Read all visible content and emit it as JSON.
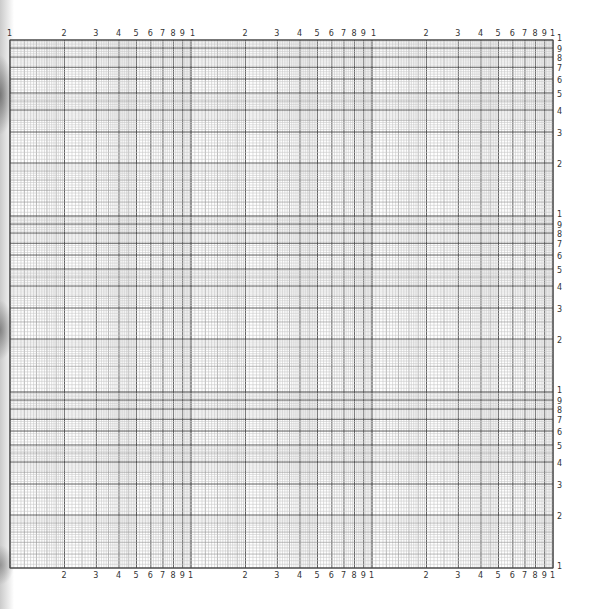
{
  "page": {
    "type": "log-log graph paper",
    "cycles_x": 3,
    "cycles_y": 3,
    "colors": {
      "background": "#ffffff",
      "major_line": "#4a4a4a",
      "minor_line": "#9a9a9a",
      "fine_line": "#c8c8c8",
      "label": "#333333"
    }
  },
  "grid": {
    "left": 10,
    "right": 553,
    "top": 40,
    "bottom": 568
  },
  "top_axis": {
    "labels": [
      "1",
      "2",
      "3",
      "4",
      "5",
      "6",
      "7",
      "8",
      "9",
      "1",
      "2",
      "3",
      "4",
      "5",
      "6",
      "7",
      "8",
      "9",
      "1",
      "2",
      "3",
      "4",
      "5",
      "6",
      "7",
      "8",
      "9",
      "1"
    ]
  },
  "bottom_axis": {
    "labels": [
      "2",
      "3",
      "4",
      "5",
      "6",
      "7",
      "8",
      "9",
      "1",
      "2",
      "3",
      "4",
      "5",
      "6",
      "7",
      "8",
      "9",
      "1",
      "2",
      "3",
      "4",
      "5",
      "6",
      "7",
      "8",
      "9",
      "1"
    ]
  },
  "right_axis": {
    "labels": [
      "1",
      "9",
      "8",
      "7",
      "6",
      "5",
      "4",
      "3",
      "2",
      "1",
      "9",
      "8",
      "7",
      "6",
      "5",
      "4",
      "3",
      "2",
      "1",
      "9",
      "8",
      "7",
      "6",
      "5",
      "4",
      "3",
      "2",
      "1"
    ]
  },
  "chart_data": {
    "type": "table",
    "title": "",
    "xlabel": "",
    "ylabel": "",
    "x_scale": "log",
    "y_scale": "log",
    "x_decades": 3,
    "y_decades": 3,
    "x_tick_labels": [
      "1",
      "2",
      "3",
      "4",
      "5",
      "6",
      "7",
      "8",
      "9",
      "1",
      "2",
      "3",
      "4",
      "5",
      "6",
      "7",
      "8",
      "9",
      "1",
      "2",
      "3",
      "4",
      "5",
      "6",
      "7",
      "8",
      "9",
      "1"
    ],
    "y_tick_labels": [
      "1",
      "2",
      "3",
      "4",
      "5",
      "6",
      "7",
      "8",
      "9",
      "1",
      "2",
      "3",
      "4",
      "5",
      "6",
      "7",
      "8",
      "9",
      "1",
      "2",
      "3",
      "4",
      "5",
      "6",
      "7",
      "8",
      "9",
      "1"
    ],
    "grid": true,
    "series": []
  }
}
